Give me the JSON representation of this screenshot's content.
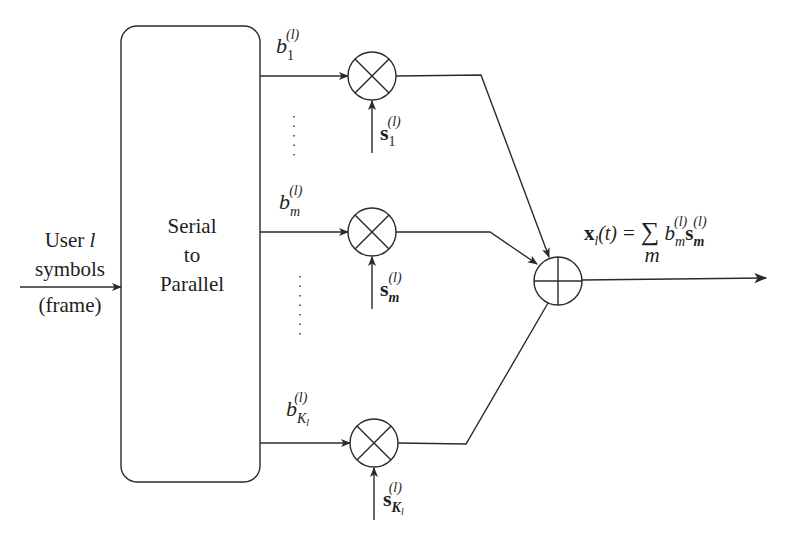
{
  "diagram": {
    "input_label": {
      "line1_prefix": "User ",
      "line1_var": "l",
      "line2": "symbols",
      "line3": "(frame)"
    },
    "block": {
      "line1": "Serial",
      "line2": "to",
      "line3": "Parallel"
    },
    "branches": [
      {
        "b_base": "b",
        "b_sub": "1",
        "b_sup": "(l)",
        "s_base": "s",
        "s_sub": "1",
        "s_sup": "(l)"
      },
      {
        "b_base": "b",
        "b_sub": "m",
        "b_sup": "(l)",
        "s_base": "s",
        "s_sub": "m",
        "s_sup": "(l)"
      },
      {
        "b_base": "b",
        "b_sub": "K",
        "b_subsub": "l",
        "b_sup": "(l)",
        "s_base": "s",
        "s_sub": "K",
        "s_subsub": "l",
        "s_sup": "(l)"
      }
    ],
    "output_equation": {
      "lhs_base": "x",
      "lhs_sub": "l",
      "lhs_arg": "(t)",
      "equals": "=",
      "sum_symbol": "∑",
      "sum_index": "m",
      "term_b": "b",
      "term_b_sub": "m",
      "term_b_sup": "(l)",
      "term_s": "s",
      "term_s_sub": "m",
      "term_s_sup": "(l)"
    },
    "symbols": {
      "multiplier": "multiplier-circle-x",
      "adder": "adder-circle-plus"
    }
  }
}
